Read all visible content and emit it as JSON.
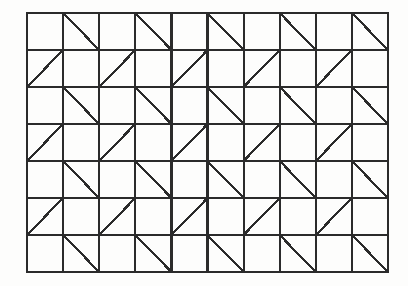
{
  "figure": {
    "type": "geometric-tiling-diagram",
    "background_color": "#fdfdfc",
    "canvas": {
      "width": 408,
      "height": 286
    },
    "grid": {
      "origin_x": 27,
      "origin_y": 13,
      "columns": 10,
      "rows": 7,
      "cell_width": 36.1,
      "cell_height": 37.0,
      "total_width": 361,
      "total_height": 259,
      "line_color": "#2b2b2b",
      "vertical_line_width": 2.2,
      "horizontal_line_width": 1.7,
      "border_line_width": 2.0
    },
    "diagonals": {
      "color": "#2b2b2b",
      "line_width": 2.2,
      "backslash_rows": [
        0,
        2,
        4,
        6
      ],
      "backslash_columns": [
        1,
        3,
        5,
        7,
        9
      ],
      "slash_rows": [
        1,
        3,
        5
      ],
      "slash_columns": [
        0,
        2,
        4,
        6,
        8
      ],
      "pattern_rule": "even rows carry backslash diagonals in odd columns; odd rows carry slash diagonals in even columns",
      "total_count": 35
    }
  }
}
